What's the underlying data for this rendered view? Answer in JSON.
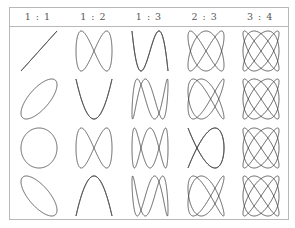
{
  "table": {
    "columns": [
      {
        "label": "1 : 1",
        "a": 1,
        "b": 1
      },
      {
        "label": "1 : 2",
        "a": 1,
        "b": 2
      },
      {
        "label": "1 : 3",
        "a": 1,
        "b": 3
      },
      {
        "label": "2 : 3",
        "a": 2,
        "b": 3
      },
      {
        "label": "3 : 4",
        "a": 3,
        "b": 4
      }
    ],
    "rows": [
      {
        "phase_deg": 0
      },
      {
        "phase_deg": 45
      },
      {
        "phase_deg": 90
      },
      {
        "phase_deg": 135
      }
    ],
    "stroke_color": "#3a3a3a",
    "border_color": "#b8b8b8"
  }
}
